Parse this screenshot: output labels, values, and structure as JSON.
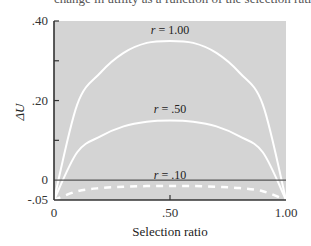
{
  "caption": "change in utility as a function of the selection ratio",
  "colors": {
    "plot_bg": "#d4d4d4",
    "curve": "#ffffff",
    "axis": "#333333",
    "zero_line": "#555555"
  },
  "chart_data": {
    "type": "line",
    "title": "",
    "xlabel": "Selection ratio",
    "ylabel": "ΔU",
    "xlim": [
      0,
      1.0
    ],
    "ylim": [
      -0.05,
      0.4
    ],
    "x_ticks": [
      {
        "value": 0,
        "label": "0"
      },
      {
        "value": 0.5,
        "label": ".50"
      },
      {
        "value": 1.0,
        "label": "1.00"
      }
    ],
    "y_ticks": [
      {
        "value": -0.05,
        "label": "-.05"
      },
      {
        "value": 0,
        "label": "0"
      },
      {
        "value": 0.2,
        "label": ".20"
      },
      {
        "value": 0.4,
        "label": ".40"
      }
    ],
    "grid": false,
    "reference_line": {
      "y": 0
    },
    "x": [
      0,
      0.1,
      0.2,
      0.3,
      0.4,
      0.5,
      0.6,
      0.7,
      0.8,
      0.9,
      1.0
    ],
    "series": [
      {
        "name": "r = 1.00",
        "label_r": "r",
        "label_val": " = 1.00",
        "style": "solid",
        "peak": 0.35,
        "values": [
          -0.05,
          0.19,
          0.27,
          0.32,
          0.345,
          0.35,
          0.345,
          0.32,
          0.27,
          0.19,
          -0.05
        ]
      },
      {
        "name": "r = .50",
        "label_r": "r",
        "label_val": " = .50",
        "style": "solid",
        "peak": 0.15,
        "values": [
          -0.05,
          0.07,
          0.11,
          0.135,
          0.147,
          0.15,
          0.147,
          0.135,
          0.11,
          0.07,
          -0.05
        ]
      },
      {
        "name": "r = .10",
        "label_r": "r",
        "label_val": " = .10",
        "style": "dashed",
        "peak": -0.015,
        "values": [
          -0.05,
          -0.028,
          -0.02,
          -0.017,
          -0.015,
          -0.015,
          -0.015,
          -0.017,
          -0.02,
          -0.028,
          -0.05
        ]
      }
    ],
    "legend": "inline labels above each curve peak"
  }
}
